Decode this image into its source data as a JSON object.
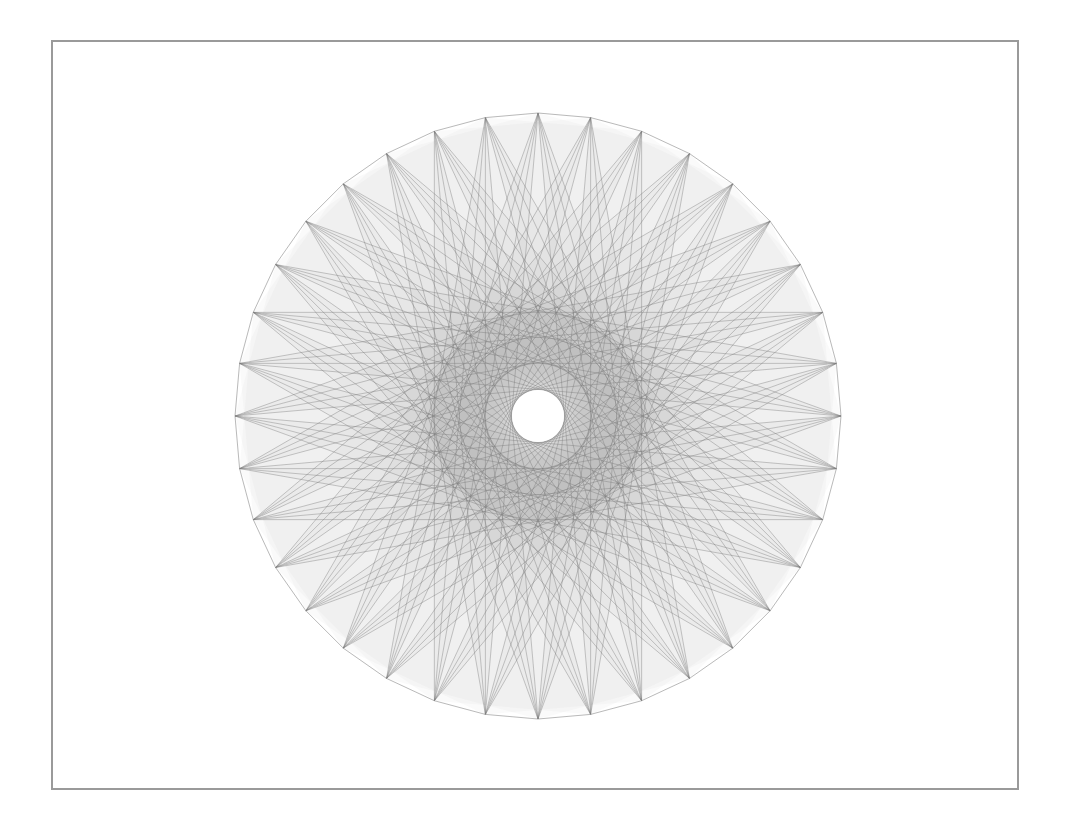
{
  "figure": {
    "type": "string-art-star-polygon",
    "frame": {
      "x": 51,
      "y": 40,
      "width": 968,
      "height": 750,
      "border_color": "#9a9a9a"
    },
    "center": {
      "x": 538,
      "y": 416
    },
    "radius": 303,
    "point_count": 36,
    "start_angle_deg": -90,
    "chord_offsets": [
      14,
      15,
      16,
      17
    ],
    "stroke_color": "#7a7a7a",
    "stroke_opacity": 0.45,
    "stroke_width": 0.9,
    "fill_color": "#9a9a9a",
    "fill_opacity": 0.05,
    "outline_color": "#8a8a8a",
    "outline_opacity": 0.6,
    "inner_ring_radius": 78,
    "center_hole_radius": 26
  }
}
